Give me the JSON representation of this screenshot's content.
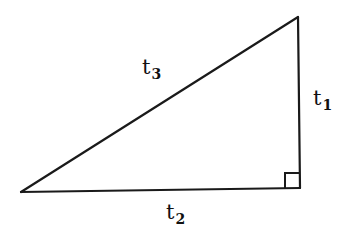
{
  "diagram": {
    "type": "right-triangle",
    "stroke_color": "#1a1a1a",
    "vertices": {
      "top": {
        "x": 298,
        "y": 17
      },
      "right_angle": {
        "x": 300,
        "y": 188
      },
      "left": {
        "x": 21,
        "y": 192
      }
    },
    "right_angle_marker": {
      "x": 285,
      "y": 173,
      "size": 15
    },
    "labels": {
      "hypotenuse": {
        "base": "t",
        "sub": "3",
        "side": "hypotenuse"
      },
      "vertical_leg": {
        "base": "t",
        "sub": "1",
        "side": "vertical leg"
      },
      "horizontal_leg": {
        "base": "t",
        "sub": "2",
        "side": "horizontal leg"
      }
    }
  }
}
